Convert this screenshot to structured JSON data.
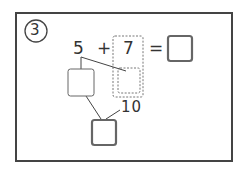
{
  "problem": {
    "number": "3",
    "equation": {
      "left": "5",
      "operator": "+",
      "right": "7",
      "equals": "=",
      "answer": ""
    },
    "decomposition": {
      "part_box": "",
      "split_box": "",
      "ten_label": "10",
      "result_box": ""
    }
  }
}
